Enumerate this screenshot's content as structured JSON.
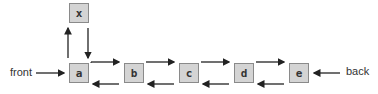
{
  "diagram": {
    "type": "doubly-linked-list",
    "nodes": [
      "a",
      "b",
      "c",
      "d",
      "e"
    ],
    "extra_node": "x",
    "labels": {
      "front": "front",
      "back": "back"
    }
  }
}
